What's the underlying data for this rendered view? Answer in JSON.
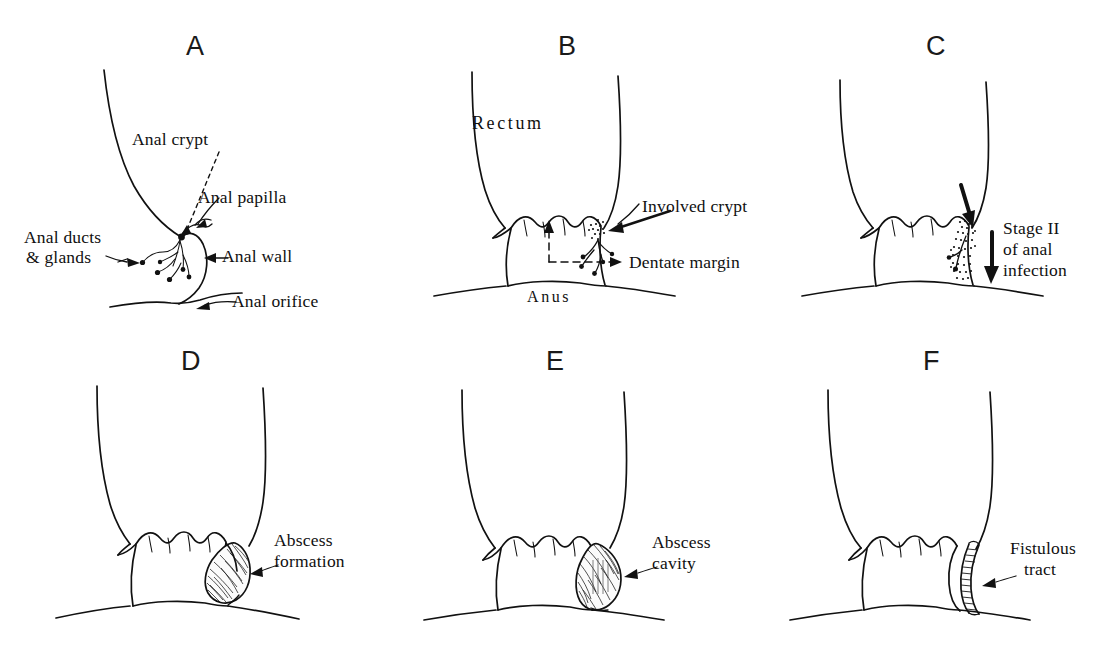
{
  "figure": {
    "background_color": "#ffffff",
    "ink_color": "#111111",
    "panel_count": 6
  },
  "panels": [
    {
      "letter": "A",
      "name": "normal-anal-anatomy",
      "labels": [
        {
          "id": "anal-crypt",
          "text": "Anal crypt"
        },
        {
          "id": "anal-papilla",
          "text": "Anal papilla"
        },
        {
          "id": "anal-ducts-line1",
          "text": "Anal ducts"
        },
        {
          "id": "anal-ducts-line2",
          "text": "& glands"
        },
        {
          "id": "anal-wall",
          "text": "Anal wall"
        },
        {
          "id": "anal-orifice",
          "text": "Anal orifice"
        }
      ]
    },
    {
      "letter": "B",
      "name": "involved-crypt",
      "labels": [
        {
          "id": "rectum",
          "text": "Rectum"
        },
        {
          "id": "anus",
          "text": "Anus"
        },
        {
          "id": "involved-crypt",
          "text": "Involved crypt"
        },
        {
          "id": "dentate-margin",
          "text": "Dentate margin"
        }
      ]
    },
    {
      "letter": "C",
      "name": "stage-two-infection",
      "labels": [
        {
          "id": "stage-line1",
          "text": "Stage II"
        },
        {
          "id": "stage-line2",
          "text": "of anal"
        },
        {
          "id": "stage-line3",
          "text": "infection"
        }
      ]
    },
    {
      "letter": "D",
      "name": "abscess-formation",
      "labels": [
        {
          "id": "abscess-formation-line1",
          "text": "Abscess"
        },
        {
          "id": "abscess-formation-line2",
          "text": "formation"
        }
      ]
    },
    {
      "letter": "E",
      "name": "abscess-cavity",
      "labels": [
        {
          "id": "abscess-cavity-line1",
          "text": "Abscess"
        },
        {
          "id": "abscess-cavity-line2",
          "text": "cavity"
        }
      ]
    },
    {
      "letter": "F",
      "name": "fistulous-tract",
      "labels": [
        {
          "id": "fistulous-tract-line1",
          "text": "Fistulous"
        },
        {
          "id": "fistulous-tract-line2",
          "text": "tract"
        }
      ]
    }
  ]
}
